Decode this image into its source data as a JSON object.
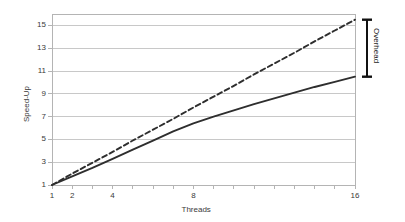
{
  "chart_data": {
    "type": "line",
    "title": "",
    "xlabel": "Threads",
    "ylabel": "Speed-Up",
    "xlim": [
      1,
      16
    ],
    "ylim": [
      1,
      16
    ],
    "grid": "horizontal",
    "legend_position": "none",
    "x_tick_values": [
      1,
      2,
      3,
      4,
      5,
      6,
      7,
      8,
      9,
      10,
      11,
      12,
      13,
      14,
      15,
      16
    ],
    "x_tick_labels": [
      "1",
      "2",
      "",
      "4",
      "",
      "",
      "",
      "8",
      "",
      "",
      "",
      "",
      "",
      "",
      "",
      "16"
    ],
    "y_tick_values": [
      1,
      3,
      5,
      7,
      9,
      11,
      13,
      15
    ],
    "y_tick_labels": [
      "1",
      "3",
      "5",
      "7",
      "9",
      "11",
      "13",
      "15"
    ],
    "series": [
      {
        "name": "Ideal Speed-Up",
        "style": "dashed",
        "color": "#2e2e2e",
        "x": [
          1,
          2,
          3,
          4,
          5,
          6,
          7,
          8,
          9,
          10,
          11,
          12,
          13,
          14,
          15,
          16
        ],
        "values": [
          1.0,
          2.0,
          2.95,
          3.9,
          4.9,
          5.85,
          6.8,
          7.8,
          8.75,
          9.7,
          10.7,
          11.65,
          12.6,
          13.6,
          14.55,
          15.5
        ]
      },
      {
        "name": "Actual Speed-Up",
        "style": "solid",
        "color": "#2e2e2e",
        "x": [
          1,
          2,
          3,
          4,
          5,
          6,
          7,
          8,
          9,
          10,
          11,
          12,
          13,
          14,
          15,
          16
        ],
        "values": [
          1.0,
          1.75,
          2.5,
          3.3,
          4.1,
          4.9,
          5.7,
          6.4,
          7.0,
          7.55,
          8.1,
          8.6,
          9.1,
          9.6,
          10.05,
          10.5
        ]
      }
    ],
    "annotations": [
      {
        "name": "overhead-bracket",
        "label": "Overhead",
        "at_x": 16,
        "from_y": 10.5,
        "to_y": 15.5
      }
    ]
  },
  "axes": {
    "x_title": "Threads",
    "y_title": "Speed-Up"
  },
  "colors": {
    "line": "#2e2e2e",
    "grid": "#c8c8c8",
    "frame": "#b4b4b4",
    "text": "#3a3a3a",
    "bracket": "#111111"
  }
}
